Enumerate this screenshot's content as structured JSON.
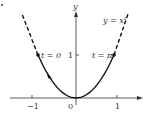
{
  "diagram": {
    "type": "parametric-curve-plot",
    "curve_label": "y = x²",
    "y_axis_label": "y",
    "x_axis_label": "x",
    "x_ticks": [
      "−1",
      "0",
      "1"
    ],
    "y_ticks": [
      "1"
    ],
    "points": [
      {
        "label": "t = 0",
        "x": -1,
        "y": 1
      },
      {
        "label": "t = π",
        "x": 1,
        "y": 1
      }
    ],
    "solid_segment": "−1 ≤ x ≤ 1",
    "dashed_segments": "x < −1 and x > 1",
    "direction": "from t = 0 toward origin then to t = π"
  }
}
